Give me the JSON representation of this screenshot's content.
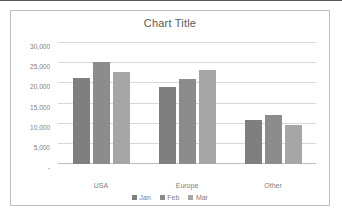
{
  "chart_data": {
    "type": "bar",
    "title": "Chart Title",
    "xlabel": "",
    "ylabel": "",
    "categories": [
      "USA",
      "Europe",
      "Other"
    ],
    "series": [
      {
        "name": "Jan",
        "values": [
          21400,
          19000,
          10800
        ],
        "color": "#7f7f7f"
      },
      {
        "name": "Feb",
        "values": [
          25200,
          21100,
          12200
        ],
        "color": "#8c8c8c"
      },
      {
        "name": "Mar",
        "values": [
          22700,
          23400,
          9600
        ],
        "color": "#a6a6a6"
      }
    ],
    "ylim": [
      0,
      30000
    ],
    "ytick_values": [
      30000,
      25000,
      20000,
      15000,
      10000,
      5000,
      0
    ],
    "ytick_labels": [
      "30,000",
      "25,000",
      "20,000",
      "15,000",
      "10,000",
      "5,000",
      "-"
    ],
    "grid": true,
    "legend_position": "bottom",
    "title_color": "#595959",
    "tick_color": "#808080",
    "gridline_color": "#d9d9d9",
    "plot_background": "#ffffff",
    "chart_border_color": "#bfbfbf"
  }
}
